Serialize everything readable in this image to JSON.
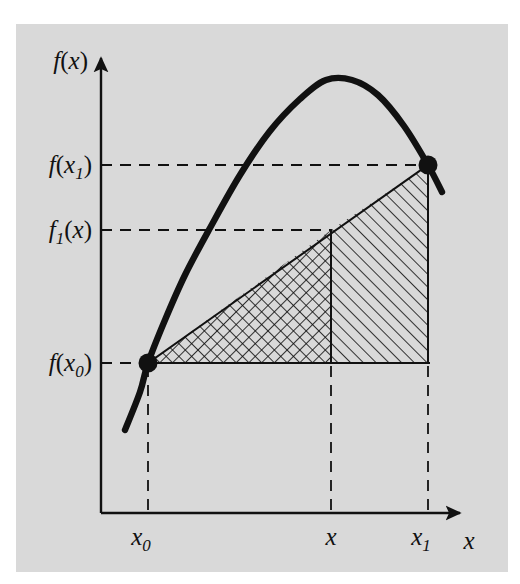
{
  "figure": {
    "kind": "math-diagram",
    "caption": "",
    "background_color": "#ffffff",
    "panel_color": "#d9d9d9",
    "ink_color": "#111111"
  },
  "axes": {
    "y_axis_label": "f(x)",
    "x_axis_label": "x",
    "y_ticks": [
      {
        "key": "f_x1",
        "label_main": "f",
        "label_paren_open": "(",
        "label_var": "x",
        "label_sub": "1",
        "label_paren_close": ")",
        "text": "f(x₁)"
      },
      {
        "key": "f1_x",
        "label_main": "f",
        "label_sub_main": "1",
        "label_paren_open": "(",
        "label_var": "x",
        "label_paren_close": ")",
        "text": "f₁(x)"
      },
      {
        "key": "f_x0",
        "label_main": "f",
        "label_paren_open": "(",
        "label_var": "x",
        "label_sub": "0",
        "label_paren_close": ")",
        "text": "f(x₀)"
      }
    ],
    "x_ticks": [
      {
        "key": "x0",
        "label_var": "x",
        "label_sub": "0",
        "text": "x₀"
      },
      {
        "key": "x",
        "label_var": "x",
        "label_sub": "",
        "text": "x"
      },
      {
        "key": "x1",
        "label_var": "x",
        "label_sub": "1",
        "text": "x₁"
      }
    ]
  },
  "chart_data": {
    "type": "line",
    "title": "",
    "xlabel": "x",
    "ylabel": "f(x)",
    "grid": false,
    "legend": "none",
    "xlim": [
      0,
      1
    ],
    "ylim": [
      0,
      1
    ],
    "x_tick_labels": [
      "x₀",
      "x",
      "x₁"
    ],
    "x_tick_positions_px": [
      148,
      331,
      428
    ],
    "y_tick_labels": [
      "f(x₁)",
      "f₁(x)",
      "f(x₀)"
    ],
    "y_tick_positions_px": [
      165,
      230,
      363
    ],
    "series": [
      {
        "name": "f(x)",
        "kind": "curve",
        "style": "thick-solid",
        "description": "concave-down parabola-like curve rising from lower left through (x0, f(x0)), peaking near x, and descending through (x1, f(x1))",
        "points_px": [
          [
            125,
            430
          ],
          [
            140,
            392
          ],
          [
            148,
            363
          ],
          [
            165,
            320
          ],
          [
            185,
            275
          ],
          [
            210,
            228
          ],
          [
            240,
            175
          ],
          [
            270,
            131
          ],
          [
            300,
            99
          ],
          [
            326,
            80
          ],
          [
            352,
            80
          ],
          [
            378,
            95
          ],
          [
            404,
            126
          ],
          [
            428,
            165
          ],
          [
            442,
            192
          ]
        ]
      },
      {
        "name": "secant f1(x)",
        "kind": "line",
        "style": "thin-solid",
        "description": "chord joining (x0, f(x0)) to (x1, f(x1))",
        "points_px": [
          [
            148,
            363
          ],
          [
            428,
            165
          ]
        ]
      }
    ],
    "markers": [
      {
        "name": "point-x0",
        "label": "(x₀, f(x₀))",
        "x_px": 148,
        "y_px": 363,
        "style": "filled-dot"
      },
      {
        "name": "point-x1",
        "label": "(x₁, f(x₁))",
        "x_px": 428,
        "y_px": 165,
        "style": "filled-dot"
      }
    ],
    "shaded_regions": [
      {
        "name": "crosshatch-region",
        "hatch": "cross-hatch",
        "description": "triangle under the chord between x₀ and x, above the f(x₀) level",
        "vertices_px": [
          [
            148,
            363
          ],
          [
            331,
            230
          ],
          [
            331,
            363
          ]
        ]
      },
      {
        "name": "hatch-region",
        "hatch": "diagonal-hatch",
        "description": "trapezoid under the chord between x and x₁, above the f(x₀) level",
        "vertices_px": [
          [
            331,
            230
          ],
          [
            428,
            165
          ],
          [
            428,
            363
          ],
          [
            331,
            363
          ]
        ]
      }
    ],
    "guide_lines": [
      {
        "name": "h-line-f-x1",
        "orientation": "horizontal",
        "style": "dashed",
        "from_px": [
          101,
          165
        ],
        "to_px": [
          428,
          165
        ]
      },
      {
        "name": "h-line-f1-x",
        "orientation": "horizontal",
        "style": "dashed",
        "from_px": [
          101,
          230
        ],
        "to_px": [
          331,
          230
        ]
      },
      {
        "name": "h-line-f-x0",
        "orientation": "horizontal",
        "style": "dashed",
        "from_px": [
          101,
          363
        ],
        "to_px": [
          148,
          363
        ]
      },
      {
        "name": "h-line-base",
        "orientation": "horizontal",
        "style": "solid",
        "from_px": [
          148,
          363
        ],
        "to_px": [
          428,
          363
        ]
      },
      {
        "name": "v-line-x0",
        "orientation": "vertical",
        "style": "dashed",
        "from_px": [
          148,
          363
        ],
        "to_px": [
          148,
          513
        ]
      },
      {
        "name": "v-line-x",
        "orientation": "vertical",
        "style": "dashed",
        "from_px": [
          331,
          363
        ],
        "to_px": [
          331,
          513
        ]
      },
      {
        "name": "v-line-x1",
        "orientation": "vertical",
        "style": "dashed",
        "from_px": [
          428,
          363
        ],
        "to_px": [
          428,
          513
        ]
      },
      {
        "name": "v-line-x-upper",
        "orientation": "vertical",
        "style": "solid",
        "from_px": [
          331,
          230
        ],
        "to_px": [
          331,
          363
        ]
      },
      {
        "name": "v-line-x1-upper",
        "orientation": "vertical",
        "style": "solid",
        "from_px": [
          428,
          165
        ],
        "to_px": [
          428,
          363
        ]
      }
    ]
  }
}
